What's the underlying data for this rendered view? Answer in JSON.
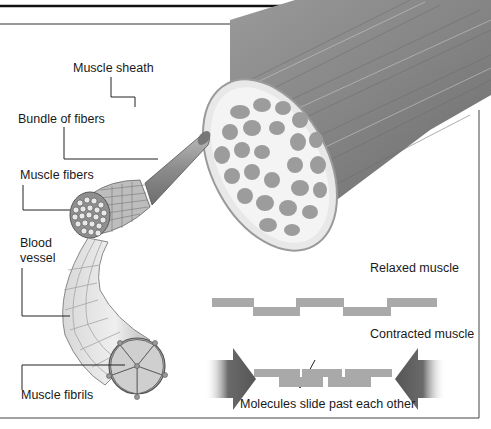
{
  "diagram": {
    "labels": {
      "muscle_sheath": "Muscle sheath",
      "bundle_of_fibers": "Bundle of fibers",
      "muscle_fibers": "Muscle fibers",
      "blood_vessel_line1": "Blood",
      "blood_vessel_line2": "vessel",
      "muscle_fibrils": "Muscle fibrils",
      "relaxed_muscle": "Relaxed muscle",
      "contracted_muscle": "Contracted muscle",
      "molecules_slide": "Molecules slide past each other"
    },
    "colors": {
      "muscle_gray": "#8a8a8a",
      "muscle_dark": "#5e5e5e",
      "sheath_light": "#e6e6e6",
      "filament_gray": "#a9a9a9",
      "arrow_dark": "#555555",
      "leader_line": "#222222",
      "frame_line": "#333333"
    }
  }
}
